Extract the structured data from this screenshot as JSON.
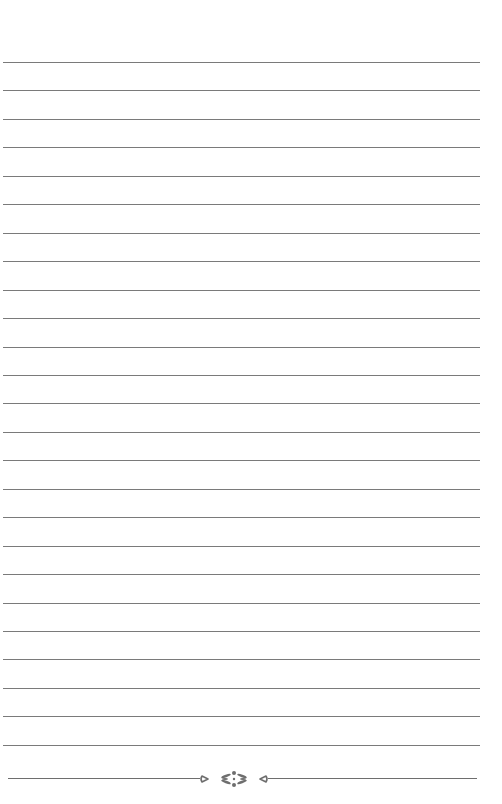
{
  "page": {
    "type": "lined-paper",
    "background": "#ffffff",
    "rule_color": "#7a7a7a",
    "rule_count": 25,
    "first_rule_y": 62,
    "rule_spacing": 28.45
  },
  "footer": {
    "ornament": "floral-divider-icon",
    "ornament_color": "#6e6e6e"
  }
}
